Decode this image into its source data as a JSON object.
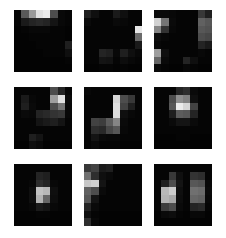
{
  "figure": {
    "title": "",
    "background_color": "#ffffff",
    "tile_background_color": "#000000",
    "colormap": "grayscale",
    "grid_rows": 3,
    "grid_cols": 3,
    "tile_cell_rows": 8,
    "tile_cell_cols": 8,
    "value_min": 0,
    "value_max": 1
  },
  "chart_data": {
    "type": "heatmap",
    "title": "",
    "subtitle": "",
    "xlabel": "",
    "ylabel": "",
    "colormap": "gray",
    "vmin": 0,
    "vmax": 1,
    "grid": false,
    "legend": "none",
    "panel_rows": 3,
    "panel_cols": 3,
    "cell_rows": 8,
    "cell_cols": 8,
    "panels": [
      {
        "name": "panel-1",
        "position": "top-left",
        "values": [
          [
            0.02,
            0.35,
            0.6,
            0.88,
            0.92,
            0.3,
            0.03,
            0.02
          ],
          [
            0.02,
            0.1,
            0.14,
            0.16,
            0.14,
            0.08,
            0.03,
            0.02
          ],
          [
            0.01,
            0.02,
            0.03,
            0.03,
            0.03,
            0.02,
            0.02,
            0.01
          ],
          [
            0.01,
            0.01,
            0.02,
            0.02,
            0.02,
            0.02,
            0.02,
            0.01
          ],
          [
            0.01,
            0.01,
            0.01,
            0.02,
            0.02,
            0.02,
            0.02,
            0.12
          ],
          [
            0.01,
            0.01,
            0.01,
            0.01,
            0.02,
            0.02,
            0.02,
            0.06
          ],
          [
            0.01,
            0.01,
            0.01,
            0.01,
            0.01,
            0.01,
            0.01,
            0.02
          ],
          [
            0.01,
            0.01,
            0.01,
            0.01,
            0.01,
            0.01,
            0.01,
            0.01
          ]
        ]
      },
      {
        "name": "panel-2",
        "position": "top-middle",
        "values": [
          [
            0.12,
            0.06,
            0.02,
            0.02,
            0.1,
            0.06,
            0.02,
            0.02
          ],
          [
            0.04,
            0.02,
            0.02,
            0.02,
            0.04,
            0.03,
            0.02,
            0.02
          ],
          [
            0.02,
            0.02,
            0.02,
            0.02,
            0.02,
            0.02,
            0.02,
            0.9
          ],
          [
            0.02,
            0.02,
            0.02,
            0.02,
            0.02,
            0.02,
            0.02,
            0.42
          ],
          [
            0.02,
            0.02,
            0.02,
            0.02,
            0.02,
            0.02,
            0.02,
            0.1
          ],
          [
            0.02,
            0.02,
            0.14,
            0.12,
            0.03,
            0.12,
            0.06,
            0.03
          ],
          [
            0.02,
            0.02,
            0.08,
            0.07,
            0.02,
            0.05,
            0.03,
            0.02
          ],
          [
            0.01,
            0.01,
            0.02,
            0.02,
            0.01,
            0.02,
            0.01,
            0.01
          ]
        ]
      },
      {
        "name": "panel-3",
        "position": "top-right",
        "values": [
          [
            0.04,
            0.04,
            0.03,
            0.02,
            0.02,
            0.02,
            0.22,
            0.12
          ],
          [
            0.82,
            0.46,
            0.04,
            0.02,
            0.02,
            0.02,
            0.38,
            0.34
          ],
          [
            0.52,
            0.2,
            0.03,
            0.02,
            0.02,
            0.02,
            0.34,
            0.32
          ],
          [
            0.05,
            0.03,
            0.02,
            0.02,
            0.02,
            0.02,
            0.3,
            0.28
          ],
          [
            0.03,
            0.02,
            0.02,
            0.02,
            0.02,
            0.02,
            0.14,
            0.1
          ],
          [
            0.62,
            0.06,
            0.02,
            0.02,
            0.02,
            0.02,
            0.03,
            0.02
          ],
          [
            0.4,
            0.04,
            0.02,
            0.02,
            0.14,
            0.06,
            0.02,
            0.02
          ],
          [
            0.04,
            0.02,
            0.01,
            0.01,
            0.03,
            0.02,
            0.01,
            0.01
          ]
        ]
      },
      {
        "name": "panel-4",
        "position": "middle-left",
        "values": [
          [
            0.02,
            0.02,
            0.02,
            0.02,
            0.02,
            0.3,
            0.14,
            0.02
          ],
          [
            0.02,
            0.1,
            0.03,
            0.02,
            0.02,
            0.62,
            0.88,
            0.04
          ],
          [
            0.02,
            0.12,
            0.04,
            0.02,
            0.02,
            0.3,
            0.46,
            0.03
          ],
          [
            0.02,
            0.04,
            0.03,
            0.14,
            0.16,
            0.2,
            0.22,
            0.03
          ],
          [
            0.02,
            0.02,
            0.02,
            0.08,
            0.1,
            0.12,
            0.08,
            0.02
          ],
          [
            0.02,
            0.02,
            0.02,
            0.02,
            0.02,
            0.02,
            0.02,
            0.02
          ],
          [
            0.02,
            0.02,
            0.12,
            0.08,
            0.02,
            0.02,
            0.02,
            0.02
          ],
          [
            0.01,
            0.01,
            0.06,
            0.04,
            0.01,
            0.01,
            0.01,
            0.01
          ]
        ]
      },
      {
        "name": "panel-5",
        "position": "center",
        "values": [
          [
            0.03,
            0.02,
            0.02,
            0.02,
            0.02,
            0.02,
            0.02,
            0.02
          ],
          [
            0.02,
            0.02,
            0.02,
            0.02,
            0.84,
            0.3,
            0.22,
            0.02
          ],
          [
            0.02,
            0.02,
            0.02,
            0.02,
            0.88,
            0.26,
            0.12,
            0.02
          ],
          [
            0.02,
            0.02,
            0.02,
            0.02,
            0.86,
            0.06,
            0.03,
            0.02
          ],
          [
            0.02,
            0.26,
            0.24,
            0.36,
            0.52,
            0.04,
            0.02,
            0.02
          ],
          [
            0.02,
            0.18,
            0.16,
            0.28,
            0.34,
            0.03,
            0.02,
            0.02
          ],
          [
            0.02,
            0.08,
            0.04,
            0.03,
            0.03,
            0.02,
            0.02,
            0.02
          ],
          [
            0.02,
            0.04,
            0.02,
            0.02,
            0.02,
            0.01,
            0.01,
            0.01
          ]
        ]
      },
      {
        "name": "panel-6",
        "position": "middle-right",
        "values": [
          [
            0.02,
            0.02,
            0.02,
            0.14,
            0.18,
            0.04,
            0.02,
            0.02
          ],
          [
            0.02,
            0.02,
            0.3,
            0.56,
            0.5,
            0.06,
            0.02,
            0.02
          ],
          [
            0.02,
            0.02,
            0.34,
            0.92,
            0.84,
            0.26,
            0.02,
            0.02
          ],
          [
            0.02,
            0.02,
            0.12,
            0.36,
            0.34,
            0.14,
            0.02,
            0.02
          ],
          [
            0.02,
            0.02,
            0.04,
            0.08,
            0.08,
            0.04,
            0.02,
            0.02
          ],
          [
            0.02,
            0.02,
            0.02,
            0.02,
            0.02,
            0.02,
            0.02,
            0.02
          ],
          [
            0.01,
            0.01,
            0.01,
            0.02,
            0.02,
            0.01,
            0.01,
            0.01
          ],
          [
            0.01,
            0.01,
            0.01,
            0.01,
            0.01,
            0.01,
            0.01,
            0.01
          ]
        ]
      },
      {
        "name": "panel-7",
        "position": "bottom-left",
        "values": [
          [
            0.02,
            0.02,
            0.02,
            0.02,
            0.02,
            0.02,
            0.02,
            0.02
          ],
          [
            0.02,
            0.02,
            0.02,
            0.14,
            0.12,
            0.02,
            0.02,
            0.02
          ],
          [
            0.02,
            0.02,
            0.03,
            0.18,
            0.14,
            0.03,
            0.02,
            0.02
          ],
          [
            0.02,
            0.02,
            0.06,
            0.76,
            0.72,
            0.06,
            0.02,
            0.02
          ],
          [
            0.02,
            0.02,
            0.06,
            0.7,
            0.4,
            0.05,
            0.02,
            0.02
          ],
          [
            0.02,
            0.02,
            0.03,
            0.1,
            0.08,
            0.03,
            0.02,
            0.02
          ],
          [
            0.01,
            0.01,
            0.01,
            0.02,
            0.02,
            0.01,
            0.01,
            0.01
          ],
          [
            0.01,
            0.01,
            0.01,
            0.01,
            0.01,
            0.01,
            0.01,
            0.01
          ]
        ]
      },
      {
        "name": "panel-8",
        "position": "bottom-middle",
        "values": [
          [
            0.22,
            0.26,
            0.1,
            0.12,
            0.02,
            0.02,
            0.02,
            0.02
          ],
          [
            0.44,
            0.18,
            0.06,
            0.04,
            0.02,
            0.02,
            0.02,
            0.02
          ],
          [
            0.78,
            0.82,
            0.08,
            0.02,
            0.02,
            0.02,
            0.02,
            0.02
          ],
          [
            0.38,
            0.3,
            0.04,
            0.02,
            0.02,
            0.02,
            0.02,
            0.02
          ],
          [
            0.34,
            0.08,
            0.02,
            0.02,
            0.02,
            0.02,
            0.02,
            0.02
          ],
          [
            0.14,
            0.04,
            0.02,
            0.02,
            0.02,
            0.02,
            0.02,
            0.02
          ],
          [
            0.06,
            0.02,
            0.01,
            0.01,
            0.01,
            0.01,
            0.01,
            0.01
          ],
          [
            0.18,
            0.03,
            0.01,
            0.01,
            0.01,
            0.01,
            0.01,
            0.01
          ]
        ]
      },
      {
        "name": "panel-9",
        "position": "bottom-right",
        "values": [
          [
            0.02,
            0.02,
            0.02,
            0.02,
            0.02,
            0.02,
            0.02,
            0.02
          ],
          [
            0.02,
            0.02,
            0.22,
            0.06,
            0.02,
            0.2,
            0.18,
            0.02
          ],
          [
            0.02,
            0.12,
            0.3,
            0.08,
            0.02,
            0.34,
            0.32,
            0.03
          ],
          [
            0.02,
            0.72,
            0.8,
            0.06,
            0.02,
            0.44,
            0.42,
            0.04
          ],
          [
            0.02,
            0.7,
            0.66,
            0.05,
            0.02,
            0.4,
            0.38,
            0.03
          ],
          [
            0.02,
            0.24,
            0.3,
            0.04,
            0.02,
            0.14,
            0.16,
            0.02
          ],
          [
            0.01,
            0.04,
            0.05,
            0.02,
            0.01,
            0.03,
            0.03,
            0.01
          ],
          [
            0.01,
            0.01,
            0.01,
            0.01,
            0.01,
            0.01,
            0.01,
            0.01
          ]
        ]
      }
    ]
  }
}
